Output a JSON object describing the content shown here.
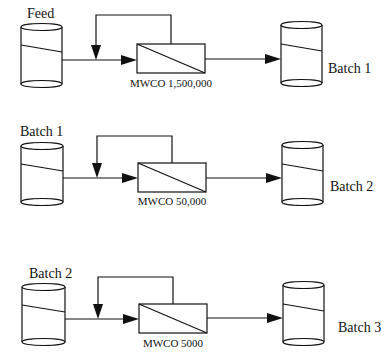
{
  "diagram": {
    "type": "process-flow",
    "stages": [
      {
        "source_label": "Feed",
        "membrane_label": "MWCO 1,500,000",
        "product_label": "Batch 1"
      },
      {
        "source_label": "Batch 1",
        "membrane_label": "MWCO 50,000",
        "product_label": "Batch 2"
      },
      {
        "source_label": "Batch 2",
        "membrane_label": "MWCO 5000",
        "product_label": "Batch 3"
      }
    ],
    "colors": {
      "stroke": "#111111",
      "background": "#ffffff"
    }
  }
}
